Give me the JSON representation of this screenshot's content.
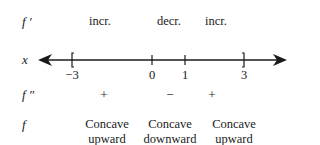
{
  "rows": {
    "fprime_label": "f ′",
    "x_label": "x",
    "fdoubleprime_label": "f ″",
    "f_label": "f"
  },
  "fprime": {
    "intervals": [
      {
        "label": "incr.",
        "x": 100
      },
      {
        "label": "decr.",
        "x": 169
      },
      {
        "label": "incr.",
        "x": 216
      }
    ]
  },
  "number_line": {
    "ticks": [
      {
        "value": "−3",
        "x": 72,
        "mark": "["
      },
      {
        "value": "0",
        "x": 152,
        "mark": "|"
      },
      {
        "value": "1",
        "x": 185,
        "mark": "|"
      },
      {
        "value": "3",
        "x": 244,
        "mark": "]"
      }
    ],
    "left_arrow_x": 38,
    "right_arrow_x": 286
  },
  "fdoubleprime": {
    "signs": [
      {
        "label": "+",
        "x": 104
      },
      {
        "label": "−",
        "x": 170
      },
      {
        "label": "+",
        "x": 212
      }
    ]
  },
  "f": {
    "concavity": [
      {
        "line1": "Concave",
        "line2": "upward",
        "x": 107
      },
      {
        "line1": "Concave",
        "line2": "downward",
        "x": 170
      },
      {
        "line1": "Concave",
        "line2": "upward",
        "x": 234
      }
    ]
  }
}
